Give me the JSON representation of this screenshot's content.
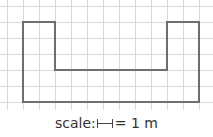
{
  "diagram": {
    "type": "floor-plan-on-grid",
    "grid": {
      "cell_px": 16,
      "origin_x": 7,
      "origin_y": 6,
      "cols": 13,
      "rows": 6,
      "line_color": "#d9d9d9"
    },
    "shape": {
      "description": "U-shaped outline",
      "stroke_color": "#6e6e6e",
      "vertices_grid": [
        [
          1,
          1
        ],
        [
          3,
          1
        ],
        [
          3,
          4
        ],
        [
          10,
          4
        ],
        [
          10,
          1
        ],
        [
          12,
          1
        ],
        [
          12,
          6
        ],
        [
          1,
          6
        ]
      ]
    }
  },
  "caption": {
    "prefix": "scale:",
    "scale_icon": "scale-bar-icon",
    "suffix": "= 1 m"
  }
}
